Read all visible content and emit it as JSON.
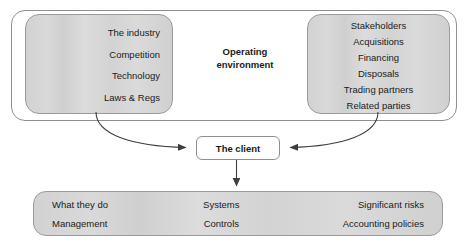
{
  "diagram": {
    "title_caption": "Operating\nenvironment",
    "environment": {
      "caption_line1": "Operating",
      "caption_line2": "environment",
      "left_box": {
        "items": [
          "The industry",
          "Competition",
          "Technology",
          "Laws & Regs"
        ]
      },
      "right_box": {
        "items": [
          "Stakeholders",
          "Acquisitions",
          "Financing",
          "Disposals",
          "Trading partners",
          "Related parties"
        ]
      }
    },
    "client": {
      "label": "The client"
    },
    "client_attributes": {
      "column_left": [
        "What they do",
        "Management"
      ],
      "column_middle": [
        "Systems",
        "Controls"
      ],
      "column_right": [
        "Significant risks",
        "Accounting policies"
      ]
    },
    "connectors": [
      {
        "name": "left-box-to-client",
        "arrow": "right"
      },
      {
        "name": "right-box-to-client",
        "arrow": "left"
      },
      {
        "name": "client-to-attributes",
        "arrow": "down"
      }
    ],
    "colors": {
      "box_fill": "#d4d4d4",
      "box_border": "#9a9a9a",
      "shell_fill": "#ffffff",
      "text": "#1b1b1b",
      "connector": "#4a4a4a"
    }
  }
}
